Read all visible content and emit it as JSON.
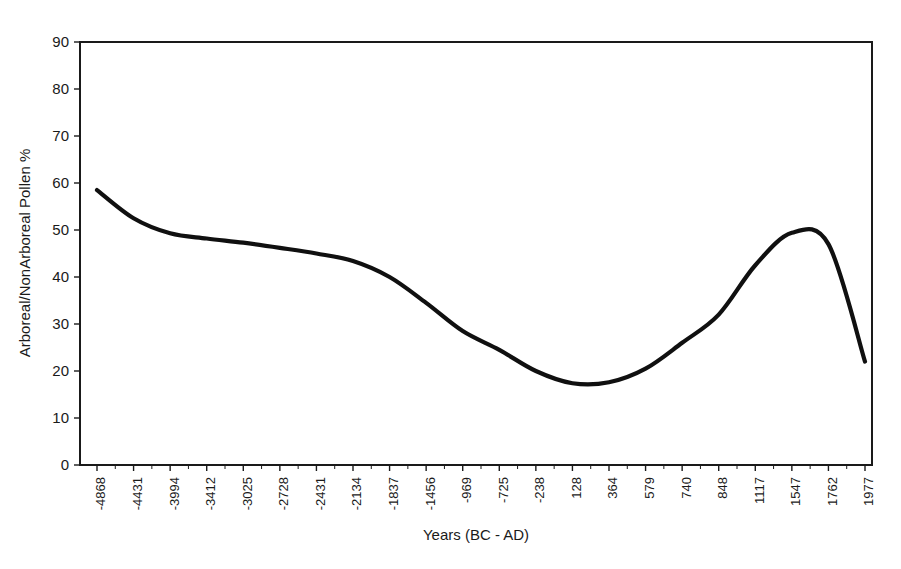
{
  "chart_data": {
    "type": "line",
    "title": "",
    "xlabel": "Years (BC - AD)",
    "ylabel": "Arboreal/NonArboreal Pollen %",
    "grid": false,
    "legend": false,
    "ylim": [
      0,
      90
    ],
    "ytick_step": 10,
    "yticks": [
      0,
      10,
      20,
      30,
      40,
      50,
      60,
      70,
      80,
      90
    ],
    "categories": [
      "-4868",
      "-4431",
      "-3994",
      "-3412",
      "-3025",
      "-2728",
      "-2431",
      "-2134",
      "-1837",
      "-1456",
      "-969",
      "-725",
      "-238",
      "128",
      "364",
      "579",
      "740",
      "848",
      "1117",
      "1547",
      "1762",
      "1977"
    ],
    "series": [
      {
        "name": "Arboreal/NonArboreal Pollen %",
        "color": "#101010",
        "values": [
          58.5,
          52.5,
          49.3,
          48.2,
          47.3,
          46.2,
          45.0,
          43.4,
          40.0,
          34.5,
          28.5,
          24.5,
          20.0,
          17.4,
          17.6,
          20.5,
          26.0,
          32.0,
          42.5,
          49.4,
          47.0,
          22.0
        ]
      }
    ]
  },
  "axes": {
    "x_title": "Years (BC - AD)",
    "y_title": "Arboreal/NonArboreal Pollen %",
    "y_min_label": "0",
    "y_max_label": "90"
  }
}
